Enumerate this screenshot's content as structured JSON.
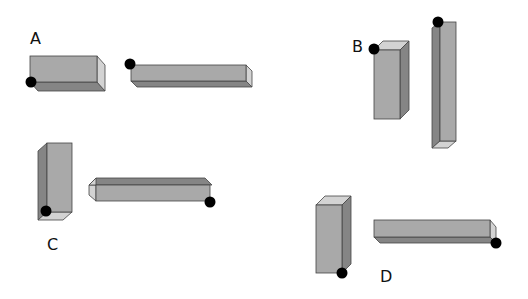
{
  "colors": {
    "front": "#a9a9a9",
    "dark": "#858585",
    "light": "#d3d3d3",
    "dot": "#000000",
    "background": "#ffffff"
  },
  "groups": [
    {
      "label": "A",
      "label_pos": [
        30,
        44
      ],
      "shapes": [
        {
          "orientation": "horizontal",
          "description": "short thick bar, dot at bottom-left front corner"
        },
        {
          "orientation": "horizontal",
          "description": "long thin bar, dot at top-left front corner"
        }
      ]
    },
    {
      "label": "B",
      "label_pos": [
        352,
        52
      ],
      "shapes": [
        {
          "orientation": "vertical",
          "description": "short thick bar, dot at top-left front corner"
        },
        {
          "orientation": "vertical",
          "description": "tall thin bar, dot at top-left corner"
        }
      ]
    },
    {
      "label": "C",
      "label_pos": [
        47,
        250
      ],
      "shapes": [
        {
          "orientation": "vertical",
          "description": "thick bar, dot at bottom-left front corner"
        },
        {
          "orientation": "horizontal",
          "description": "long thin bar, dot at bottom-right front corner"
        }
      ]
    },
    {
      "label": "D",
      "label_pos": [
        380,
        282
      ],
      "shapes": [
        {
          "orientation": "vertical",
          "description": "thick bar, dot at bottom-right corner"
        },
        {
          "orientation": "horizontal",
          "description": "long thin bar, dot at bottom-right corner"
        }
      ]
    }
  ]
}
